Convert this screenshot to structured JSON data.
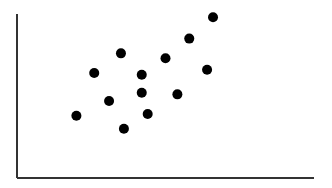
{
  "chart_data": {
    "type": "scatter",
    "title": "",
    "xlabel": "",
    "ylabel": "",
    "xlim": [
      0,
      10
    ],
    "ylim": [
      0,
      10
    ],
    "grid": false,
    "legend": null,
    "x_ticks": [],
    "y_ticks": [],
    "series": [
      {
        "name": "points",
        "color": "#000000",
        "points": [
          {
            "x": 2.0,
            "y": 3.8
          },
          {
            "x": 2.6,
            "y": 6.4
          },
          {
            "x": 3.1,
            "y": 4.7
          },
          {
            "x": 3.5,
            "y": 7.6
          },
          {
            "x": 3.6,
            "y": 3.0
          },
          {
            "x": 4.2,
            "y": 6.3
          },
          {
            "x": 4.2,
            "y": 5.2
          },
          {
            "x": 4.4,
            "y": 3.9
          },
          {
            "x": 5.0,
            "y": 7.3
          },
          {
            "x": 5.4,
            "y": 5.1
          },
          {
            "x": 5.8,
            "y": 8.5
          },
          {
            "x": 6.4,
            "y": 6.6
          },
          {
            "x": 6.6,
            "y": 9.8
          }
        ]
      }
    ]
  },
  "style": {
    "axis_color": "#333333",
    "point_color": "#000000",
    "background": "#ffffff"
  }
}
